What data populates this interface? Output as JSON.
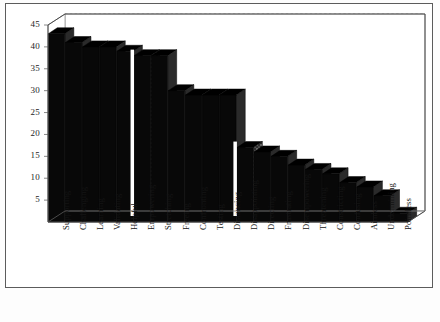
{
  "chart_data": {
    "type": "bar",
    "title": "",
    "xlabel": "",
    "ylabel": "",
    "ylim": [
      0,
      45
    ],
    "yticks": [
      5,
      10,
      15,
      20,
      25,
      30,
      35,
      40,
      45
    ],
    "grid": true,
    "legend": false,
    "legend_position": "none",
    "style": "3d-bar",
    "bar_color": "#111111",
    "side_face_color": "#3b3b3b",
    "categories": [
      "Supporting",
      "Challenging",
      "Learning",
      "Validating",
      "Helpful",
      "Empowering",
      "Stretching",
      "Freeing",
      "Confronting",
      "Testing",
      "Distancing",
      "Disappointing",
      "Directing",
      "Frustrating",
      "Disempowering",
      "Threatening",
      "Constricting",
      "Confusing",
      "Aimless",
      "Undermining",
      "Pointless"
    ],
    "values": [
      43,
      41,
      40,
      40,
      39,
      38,
      38,
      30,
      29,
      29,
      29,
      17,
      16,
      15,
      13,
      12,
      11,
      9,
      8,
      6,
      2
    ]
  },
  "axis": {
    "y_tick_labels": [
      "45",
      "40",
      "35",
      "30",
      "25",
      "20",
      "15",
      "10",
      "5"
    ]
  }
}
